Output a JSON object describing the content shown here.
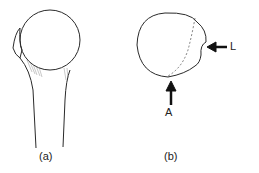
{
  "figure": {
    "panels": [
      {
        "id": "a",
        "caption": "(a)",
        "subject": "proximal humerus, anterior view"
      },
      {
        "id": "b",
        "caption": "(b)",
        "subject": "humeral head, superior view",
        "arrows": [
          {
            "label": "A",
            "direction": "up"
          },
          {
            "label": "L",
            "direction": "left"
          }
        ]
      }
    ],
    "stroke_color": "#2a2a2a",
    "background": "#ffffff"
  }
}
